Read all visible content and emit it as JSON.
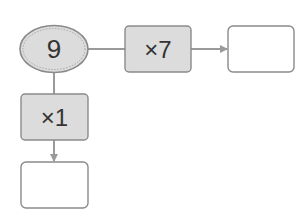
{
  "diagram": {
    "start": {
      "value": "9",
      "shape": "ellipse"
    },
    "operations": [
      {
        "label": "×7",
        "direction": "right"
      },
      {
        "label": "×1",
        "direction": "down"
      }
    ],
    "results": [
      {
        "value": "",
        "position": "right"
      },
      {
        "value": "",
        "position": "bottom"
      }
    ]
  },
  "colors": {
    "node_fill": "#dcdcdc",
    "node_stroke": "#8a8a8a",
    "ellipse_inner_dash": "#a8a8a8",
    "connector": "#9a9a9a",
    "result_fill": "#ffffff",
    "text": "#333333"
  }
}
